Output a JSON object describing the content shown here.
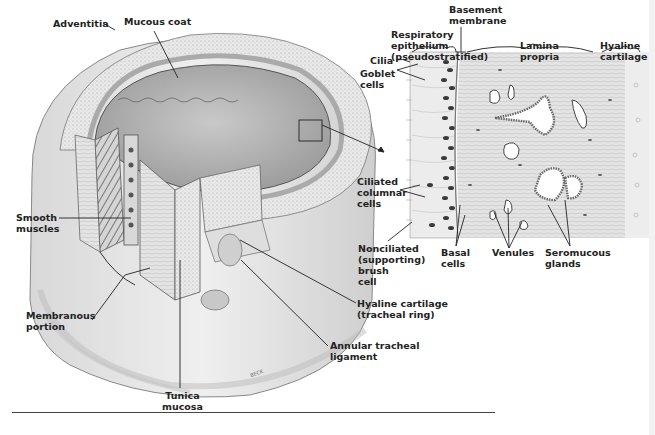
{
  "figure": {
    "signature": "BECK",
    "labels": {
      "mucous_coat": "Mucous coat",
      "adventitia": "Adventitia",
      "smooth_muscles": "Smooth\nmuscles",
      "membranous_portion": "Membranous\nportion",
      "tunica_mucosa": "Tunica\nmucosa",
      "annular_tracheal_ligament": "Annular tracheal\nligament",
      "hyaline_cartilage_ring": "Hyaline cartilage\n(tracheal ring)",
      "basement_membrane": "Basement\nmembrane",
      "respiratory_epithelium": "Respiratory\nepithelium\n(pseudostratified)",
      "lamina_propria": "Lamina\npropria",
      "hyaline_cartilage": "Hyaline\ncartilage",
      "cilia": "Cilia",
      "goblet_cells": "Goblet\ncells",
      "ciliated_columnar_cells": "Ciliated\ncolumnar\ncells",
      "nonciliated_brush_cell": "Nonciliated\n(supporting)\nbrush\ncell",
      "basal_cells": "Basal\ncells",
      "venules": "Venules",
      "seromucous_glands": "Seromucous\nglands"
    }
  },
  "colors": {
    "ink": "#222222",
    "tissue_light": "#e6e6e6",
    "tissue_mid": "#c8c8c8",
    "tissue_dark": "#8a8a8a",
    "lumen": "#b5b5b5",
    "nucleus": "#3a3a3a"
  }
}
